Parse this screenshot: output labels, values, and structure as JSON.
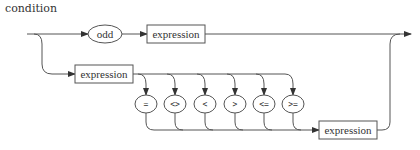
{
  "diagram": {
    "title": "condition",
    "type": "railroad-syntax-diagram",
    "branch1": {
      "terminal": "odd",
      "nonterminal": "expression"
    },
    "branch2": {
      "left_nonterminal": "expression",
      "operators": [
        "=",
        "<>",
        "<",
        ">",
        "<=",
        ">="
      ],
      "right_nonterminal": "expression"
    },
    "colors": {
      "line": "#555555",
      "text": "#333333",
      "background": "#ffffff"
    }
  }
}
